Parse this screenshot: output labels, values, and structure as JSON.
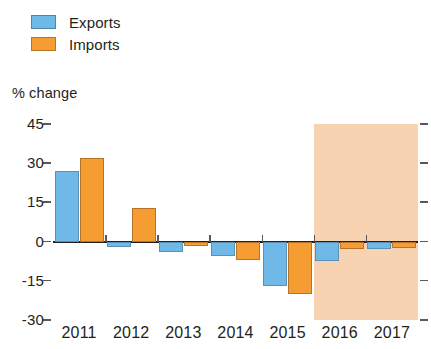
{
  "legend": {
    "items": [
      {
        "label": "Exports",
        "key": "exports",
        "color": "#6fb9e8"
      },
      {
        "label": "Imports",
        "key": "imports",
        "color": "#f59c33"
      }
    ]
  },
  "axis": {
    "y_title": "% change",
    "y_ticks": [
      "45",
      "30",
      "15",
      "0",
      "-15",
      "-30"
    ]
  },
  "chart_data": {
    "type": "bar",
    "title": "",
    "subtitle": "",
    "xlabel": "",
    "ylabel": "% change",
    "categories": [
      "2011",
      "2012",
      "2013",
      "2014",
      "2015",
      "2016",
      "2017"
    ],
    "series": [
      {
        "name": "Exports",
        "color": "#6fb9e8",
        "values": [
          27,
          -2,
          -4,
          -5.5,
          -17,
          -7.5,
          -3
        ]
      },
      {
        "name": "Imports",
        "color": "#f59c33",
        "values": [
          32,
          13,
          -1.5,
          -7,
          -20,
          -3,
          -2.5
        ]
      }
    ],
    "ylim": [
      -30,
      45
    ],
    "ytick_values": [
      45,
      30,
      15,
      0,
      -15,
      -30
    ],
    "grid": false,
    "legend_position": "top-left",
    "zero_line": true,
    "forecast": {
      "label": "",
      "shaded_color": "#f8d3b2",
      "start_category": "2016",
      "categories": [
        "2016",
        "2017"
      ]
    }
  }
}
